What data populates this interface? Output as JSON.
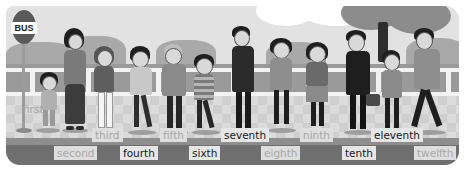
{
  "illustration": {
    "description": "People queuing at a bus stop, labeled with ordinal numbers",
    "bus_stop_sign": "BUS",
    "ordinals": [
      {
        "position": 1,
        "label": "first",
        "style": "light"
      },
      {
        "position": 2,
        "label": "second",
        "style": "light"
      },
      {
        "position": 3,
        "label": "third",
        "style": "light"
      },
      {
        "position": 4,
        "label": "fourth",
        "style": "dark"
      },
      {
        "position": 5,
        "label": "fifth",
        "style": "light"
      },
      {
        "position": 6,
        "label": "sixth",
        "style": "dark"
      },
      {
        "position": 7,
        "label": "seventh",
        "style": "dark"
      },
      {
        "position": 8,
        "label": "eighth",
        "style": "light"
      },
      {
        "position": 9,
        "label": "ninth",
        "style": "light"
      },
      {
        "position": 10,
        "label": "tenth",
        "style": "dark"
      },
      {
        "position": 11,
        "label": "eleventh",
        "style": "dark"
      },
      {
        "position": 12,
        "label": "twelfth",
        "style": "light"
      }
    ],
    "colors": {
      "dark_label_text": "#1a1a1a",
      "light_label_text": "#a8a8a8",
      "label_background": "#e3e3e3",
      "road": "#6f6f6f",
      "sidewalk": "#cfcfcf",
      "wall": "#9a9a9a"
    }
  }
}
